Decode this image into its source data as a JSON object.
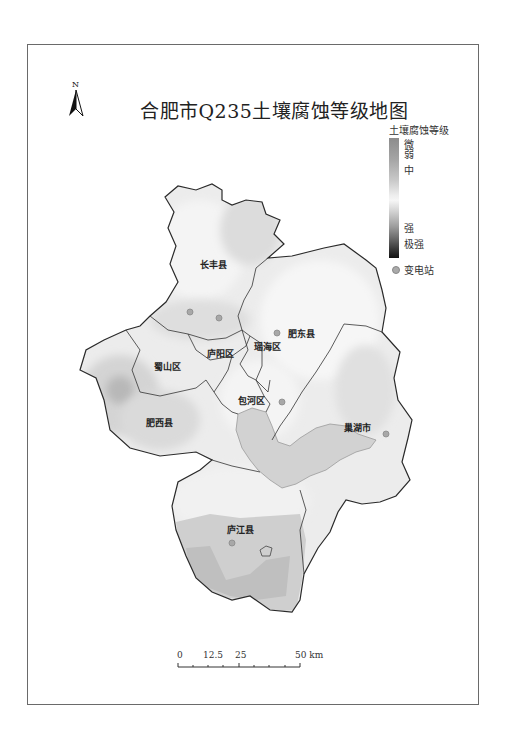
{
  "map": {
    "title": "合肥市Q235土壤腐蚀等级地图",
    "north_arrow": {
      "label": "N",
      "icon": "north-arrow-icon"
    },
    "legend": {
      "title": "土壤腐蚀等级",
      "levels": [
        {
          "label": "微",
          "position": "top"
        },
        {
          "label": "弱",
          "position": "top"
        },
        {
          "label": "中",
          "position": "upper-middle"
        },
        {
          "label": "强",
          "position": "lower-middle"
        },
        {
          "label": "极强",
          "position": "bottom"
        }
      ],
      "colors": {
        "weak": "#8c8c8c",
        "middle": "#f4f4f4",
        "extreme": "#121212"
      },
      "substation_label": "变电站",
      "substation_icon": "circle-dot-icon"
    },
    "regions": [
      {
        "name": "长丰县"
      },
      {
        "name": "肥东县"
      },
      {
        "name": "瑶海区"
      },
      {
        "name": "庐阳区"
      },
      {
        "name": "蜀山区"
      },
      {
        "name": "包河区"
      },
      {
        "name": "肥西县"
      },
      {
        "name": "巢湖市"
      },
      {
        "name": "庐江县"
      }
    ],
    "substations": [
      {
        "x": 190,
        "y": 312
      },
      {
        "x": 219,
        "y": 318
      },
      {
        "x": 277,
        "y": 333
      },
      {
        "x": 282,
        "y": 402
      },
      {
        "x": 386,
        "y": 434
      },
      {
        "x": 232,
        "y": 543
      }
    ],
    "scale_bar": {
      "ticks": [
        "0",
        "12.5",
        "25",
        "50 km"
      ],
      "unit": "km"
    }
  }
}
